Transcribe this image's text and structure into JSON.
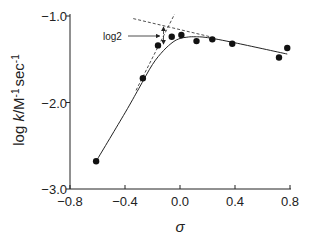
{
  "chart_data": {
    "type": "scatter",
    "title": "",
    "xlabel": "σ",
    "ylabel_parts": {
      "prefix": "log ",
      "italic": "k",
      "mid": "/M",
      "sup1": "-1",
      "sec": "sec",
      "sup2": "-1"
    },
    "xlim": [
      -0.8,
      0.8
    ],
    "ylim": [
      -3.0,
      -1.0
    ],
    "x_ticks": [
      "-0.8",
      "-0.4",
      "0.0",
      "0.4",
      "0.8"
    ],
    "x_tick_values": [
      -0.8,
      -0.4,
      0.0,
      0.4,
      0.8
    ],
    "y_ticks": [
      "-1.0",
      "-2.0",
      "-3.0"
    ],
    "y_tick_values": [
      -1.0,
      -2.0,
      -3.0
    ],
    "grid": false,
    "legend": null,
    "series": [
      {
        "name": "observed",
        "kind": "points",
        "x": [
          -0.61,
          -0.27,
          -0.16,
          -0.06,
          0.01,
          0.12,
          0.235,
          0.38,
          0.72,
          0.78
        ],
        "y": [
          -2.68,
          -1.72,
          -1.34,
          -1.24,
          -1.22,
          -1.29,
          -1.27,
          -1.32,
          -1.48,
          -1.37
        ]
      },
      {
        "name": "fitted curve",
        "kind": "solid-line",
        "x": [
          -0.61,
          -0.4,
          -0.3,
          -0.2,
          -0.12,
          -0.05,
          0.0,
          0.05,
          0.1,
          0.2,
          0.4,
          0.78
        ],
        "y": [
          -2.68,
          -2.12,
          -1.84,
          -1.56,
          -1.4,
          -1.3,
          -1.26,
          -1.245,
          -1.24,
          -1.25,
          -1.31,
          -1.44
        ]
      },
      {
        "name": "asymptote rising",
        "kind": "dashed-line",
        "x": [
          -0.32,
          -0.04
        ],
        "y": [
          -1.86,
          -0.98
        ]
      },
      {
        "name": "asymptote falling",
        "kind": "dashed-line",
        "x": [
          -0.34,
          0.22
        ],
        "y": [
          -1.03,
          -1.24
        ]
      }
    ],
    "annotations": [
      {
        "text": "log2",
        "arrow_to": [
          -0.12,
          -1.22
        ],
        "note": "vertical double arrow between asymptote intersection and curve at σ≈-0.12"
      }
    ]
  }
}
